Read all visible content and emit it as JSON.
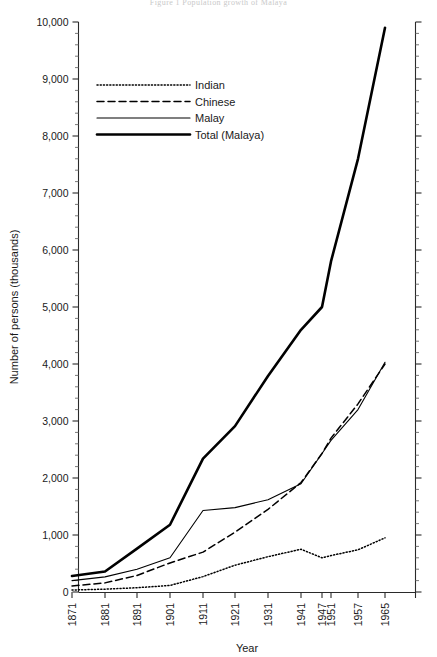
{
  "figure": {
    "top_caption": "Figure 1  Population growth of Malaya"
  },
  "chart_data": {
    "type": "line",
    "title": "",
    "xlabel": "Year",
    "ylabel": "Number of persons (thousands)",
    "x": [
      1871,
      1881,
      1891,
      1901,
      1911,
      1921,
      1931,
      1941,
      1947,
      1951,
      1957,
      1965
    ],
    "categories": [
      "1871",
      "1881",
      "1891",
      "1901",
      "1911",
      "1921",
      "1931",
      "1941",
      "1947",
      "1951",
      "1957",
      "1965"
    ],
    "xlim": [
      1871,
      1965
    ],
    "ylim": [
      0,
      10000
    ],
    "yticks": [
      0,
      1000,
      2000,
      3000,
      4000,
      5000,
      6000,
      7000,
      8000,
      9000,
      10000
    ],
    "ytick_labels": [
      "0",
      "1,000",
      "2,000",
      "3,000",
      "4,000",
      "5,000",
      "6,000",
      "7,000",
      "8,000",
      "9,000",
      "10,000"
    ],
    "y_minor_step": 200,
    "grid": false,
    "legend_position": "upper-left",
    "series": [
      {
        "name": "Indian",
        "style": "dotted",
        "values": [
          35,
          50,
          75,
          115,
          270,
          470,
          620,
          750,
          600,
          640,
          740,
          950
        ]
      },
      {
        "name": "Chinese",
        "style": "dashed",
        "values": [
          105,
          160,
          290,
          510,
          700,
          1050,
          1450,
          1920,
          2430,
          2700,
          3300,
          4000
        ]
      },
      {
        "name": "Malay",
        "style": "solid-thin",
        "values": [
          200,
          265,
          400,
          600,
          1430,
          1480,
          1620,
          1900,
          2430,
          2660,
          3200,
          4030
        ]
      },
      {
        "name": "Total (Malaya)",
        "style": "solid-thick",
        "values": [
          280,
          360,
          760,
          1180,
          2340,
          2910,
          3790,
          4600,
          5000,
          5800,
          7600,
          9900
        ]
      }
    ]
  },
  "legend": {
    "entries": [
      {
        "label": "Indian"
      },
      {
        "label": "Chinese"
      },
      {
        "label": "Malay"
      },
      {
        "label": "Total (Malaya)"
      }
    ]
  },
  "axes": {
    "y_title": "Number of persons (thousands)",
    "x_title": "Year"
  }
}
